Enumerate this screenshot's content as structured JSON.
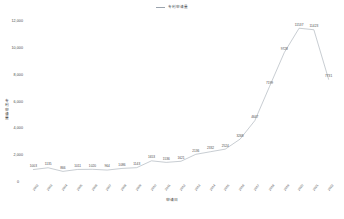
{
  "legend": {
    "entries": [
      {
        "label": "专利申请量",
        "color": "#9aa3ad",
        "icon": "line-swatch"
      }
    ]
  },
  "axes": {
    "y_title": "专利申请量",
    "x_title": "申请日",
    "y_ticks": [
      "12,000",
      "10,000",
      "8,000",
      "6,000",
      "4,000",
      "2,000",
      "0"
    ],
    "y_min": 0,
    "y_max": 12000,
    "zero_label": "0"
  },
  "chart_data": {
    "type": "line",
    "title": "",
    "subtitle": "",
    "xlabel": "申请日",
    "ylabel": "专利申请量",
    "ylim": [
      0,
      12000
    ],
    "grid": false,
    "legend_position": "top-center",
    "categories": [
      "2002",
      "2003",
      "2004",
      "2005",
      "2006",
      "2007",
      "2008",
      "2009",
      "2010",
      "2011",
      "2012",
      "2013",
      "2014",
      "2015",
      "2016",
      "2017",
      "2018",
      "2019",
      "2020",
      "2021",
      "2022"
    ],
    "series": [
      {
        "name": "专利申请量",
        "color": "#9aa3ad",
        "values": [
          1003,
          1135,
          866,
          1011,
          1020,
          964,
          1086,
          1143,
          1653,
          1536,
          1621,
          2136,
          2332,
          2524,
          3268,
          4647,
          7199,
          9728,
          11537,
          11423,
          7731
        ],
        "labels": [
          "1003",
          "1135",
          "866",
          "1011",
          "1020",
          "964",
          "1086",
          "1143",
          "1653",
          "1536",
          "1621",
          "2136",
          "2332",
          "2524",
          "3268",
          "4647",
          "7199",
          "9728",
          "11537",
          "11423",
          "7731"
        ]
      }
    ]
  }
}
